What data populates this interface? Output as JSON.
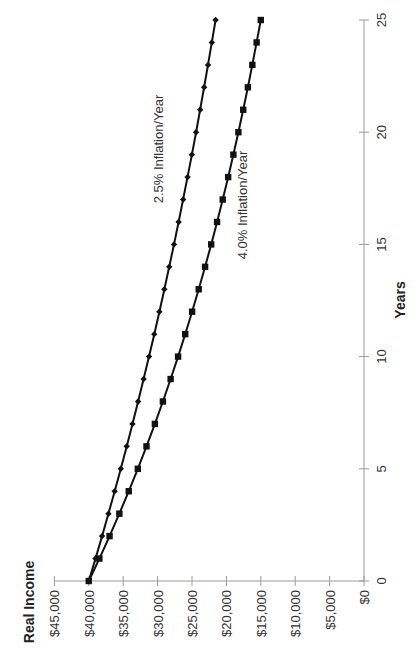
{
  "chart_data": {
    "type": "line",
    "orientation": "rotated 90° counter-clockwise (value axis runs horizontally along bottom, years axis runs vertically on right)",
    "title": "",
    "xlabel": "Years",
    "ylabel": "Real Income",
    "x": [
      0,
      1,
      2,
      3,
      4,
      5,
      6,
      7,
      8,
      9,
      10,
      11,
      12,
      13,
      14,
      15,
      16,
      17,
      18,
      19,
      20,
      21,
      22,
      23,
      24,
      25
    ],
    "x_ticks": [
      "0",
      "5",
      "10",
      "15",
      "20",
      "25"
    ],
    "y_ticks": [
      "$45,000",
      "$40,000",
      "$35,000",
      "$30,000",
      "$25,000",
      "$20,000",
      "$15,000",
      "$10,000",
      "$5,000",
      "$0"
    ],
    "xlim": [
      0,
      25
    ],
    "ylim": [
      0,
      45000
    ],
    "grid": false,
    "legend": "inline labels",
    "series": [
      {
        "name": "2.5% Inflation/Year",
        "marker": "diamond",
        "values": [
          40000,
          39024,
          38073,
          37144,
          36238,
          35354,
          34492,
          33651,
          32830,
          32029,
          31248,
          30486,
          29742,
          29017,
          28309,
          27619,
          26945,
          26288,
          25647,
          25021,
          24411,
          23816,
          23235,
          22668,
          22115,
          21577
        ]
      },
      {
        "name": "4.0% Inflation/Year",
        "marker": "square",
        "values": [
          40000,
          38462,
          36982,
          35560,
          34192,
          32877,
          31612,
          30396,
          29228,
          28104,
          27023,
          25983,
          24984,
          24023,
          23099,
          22211,
          21357,
          20535,
          19745,
          18986,
          18255,
          17553,
          16878,
          16229,
          15605,
          15005
        ]
      }
    ]
  },
  "labels": {
    "y_axis_title": "Real Income",
    "x_axis_title": "Years",
    "series_1_label": "2.5% Inflation/Year",
    "series_2_label": "4.0% Inflation/Year"
  },
  "colors": {
    "line": "#111111",
    "axis": "#9a9a9a",
    "text": "#333333"
  }
}
